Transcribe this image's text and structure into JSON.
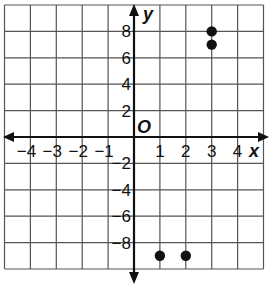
{
  "chart_data": {
    "type": "scatter",
    "title": "",
    "xlabel": "x",
    "ylabel": "y",
    "origin_label": "O",
    "xlim": [
      -5,
      5
    ],
    "ylim": [
      -10,
      10
    ],
    "x_ticks": [
      "-4",
      "-3",
      "-2",
      "-1",
      "1",
      "2",
      "3",
      "4"
    ],
    "y_ticks": [
      "8",
      "6",
      "4",
      "2",
      "-2",
      "-4",
      "-6",
      "-8"
    ],
    "grid": true,
    "points": [
      {
        "x": 3,
        "y": 8
      },
      {
        "x": 3,
        "y": 7
      },
      {
        "x": 1,
        "y": -9
      },
      {
        "x": 2,
        "y": -9
      }
    ]
  }
}
